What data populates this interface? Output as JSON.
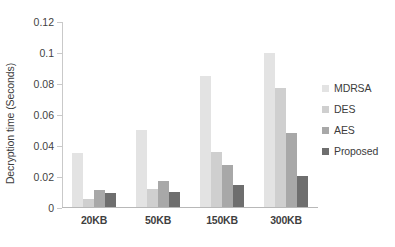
{
  "chart_data": {
    "type": "bar",
    "title": "",
    "xlabel": "",
    "ylabel": "Decryption time (Seconds)",
    "categories": [
      "20KB",
      "50KB",
      "150KB",
      "300KB"
    ],
    "series": [
      {
        "name": "MDRSA",
        "color": "#e3e3e3",
        "values": [
          0.035,
          0.05,
          0.085,
          0.1
        ]
      },
      {
        "name": "DES",
        "color": "#cfcfcf",
        "values": [
          0.005,
          0.012,
          0.036,
          0.077
        ]
      },
      {
        "name": "AES",
        "color": "#a8a8a8",
        "values": [
          0.011,
          0.017,
          0.027,
          0.048
        ]
      },
      {
        "name": "Proposed",
        "color": "#6e6e6e",
        "values": [
          0.009,
          0.01,
          0.014,
          0.02
        ]
      }
    ],
    "ylim": [
      0,
      0.12
    ],
    "yticks": [
      "0",
      "0.02",
      "0.04",
      "0.06",
      "0.08",
      "0.1",
      "0.12"
    ],
    "ytick_values": [
      0,
      0.02,
      0.04,
      0.06,
      0.08,
      0.1,
      0.12
    ],
    "grid": false,
    "legend_position": "right"
  }
}
